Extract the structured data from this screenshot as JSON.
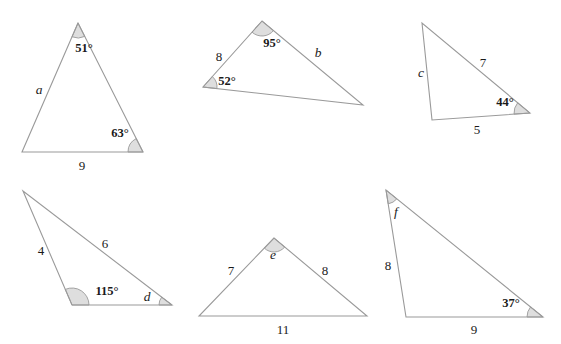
{
  "figure": {
    "background_color": "#ffffff",
    "line_color": "#9a9a9a",
    "arc_fill_color": "#dedede",
    "text_color": "#1a1a1a",
    "width": 561,
    "height": 344
  },
  "triangles": [
    {
      "id": "triangle-1",
      "vertices": [
        [
          78,
          23
        ],
        [
          22,
          152
        ],
        [
          143,
          152
        ]
      ],
      "labels": [
        {
          "name": "angle-51",
          "text": "51°",
          "kind": "angle",
          "x": 84,
          "y": 48
        },
        {
          "name": "side-a",
          "text": "a",
          "kind": "variable",
          "x": 39,
          "y": 90
        },
        {
          "name": "angle-63",
          "text": "63°",
          "kind": "angle",
          "x": 120,
          "y": 133
        },
        {
          "name": "side-9",
          "text": "9",
          "kind": "number",
          "x": 82,
          "y": 165
        }
      ],
      "arcs": [
        {
          "name": "arc-at-apex",
          "vertex": [
            78,
            23
          ],
          "to_a": [
            22,
            152
          ],
          "to_b": [
            143,
            152
          ],
          "radius": 15
        },
        {
          "name": "arc-at-bottom-right",
          "vertex": [
            143,
            152
          ],
          "to_a": [
            78,
            23
          ],
          "to_b": [
            22,
            152
          ],
          "radius": 15
        }
      ]
    },
    {
      "id": "triangle-2",
      "vertices": [
        [
          262,
          21
        ],
        [
          203,
          87
        ],
        [
          363,
          105
        ]
      ],
      "labels": [
        {
          "name": "angle-95",
          "text": "95°",
          "kind": "angle",
          "x": 272,
          "y": 43
        },
        {
          "name": "side-8",
          "text": "8",
          "kind": "number",
          "x": 219,
          "y": 56
        },
        {
          "name": "angle-52",
          "text": "52°",
          "kind": "angle",
          "x": 227,
          "y": 81
        },
        {
          "name": "side-b",
          "text": "b",
          "kind": "variable",
          "x": 318,
          "y": 53
        }
      ],
      "arcs": [
        {
          "name": "arc-at-apex",
          "vertex": [
            262,
            21
          ],
          "to_a": [
            203,
            87
          ],
          "to_b": [
            363,
            105
          ],
          "radius": 15
        },
        {
          "name": "arc-at-left",
          "vertex": [
            203,
            87
          ],
          "to_a": [
            262,
            21
          ],
          "to_b": [
            363,
            105
          ],
          "radius": 14
        }
      ]
    },
    {
      "id": "triangle-3",
      "vertices": [
        [
          422,
          23
        ],
        [
          432,
          120
        ],
        [
          530,
          113
        ]
      ],
      "labels": [
        {
          "name": "side-c",
          "text": "c",
          "kind": "variable",
          "x": 421,
          "y": 73
        },
        {
          "name": "side-7",
          "text": "7",
          "kind": "number",
          "x": 483,
          "y": 62
        },
        {
          "name": "angle-44",
          "text": "44°",
          "kind": "angle",
          "x": 505,
          "y": 102
        },
        {
          "name": "side-5",
          "text": "5",
          "kind": "number",
          "x": 477,
          "y": 129
        }
      ],
      "arcs": [
        {
          "name": "arc-at-right",
          "vertex": [
            530,
            113
          ],
          "to_a": [
            422,
            23
          ],
          "to_b": [
            432,
            120
          ],
          "radius": 16
        }
      ]
    },
    {
      "id": "triangle-4",
      "vertices": [
        [
          23,
          191
        ],
        [
          72,
          305
        ],
        [
          172,
          305
        ]
      ],
      "labels": [
        {
          "name": "side-4",
          "text": "4",
          "kind": "number",
          "x": 41,
          "y": 250
        },
        {
          "name": "side-6",
          "text": "6",
          "kind": "number",
          "x": 105,
          "y": 243
        },
        {
          "name": "angle-115",
          "text": "115°",
          "kind": "angle",
          "x": 107,
          "y": 291
        },
        {
          "name": "angle-d",
          "text": "d",
          "kind": "variable",
          "x": 147,
          "y": 297
        }
      ],
      "arcs": [
        {
          "name": "arc-at-bottom-left",
          "vertex": [
            72,
            305
          ],
          "to_a": [
            23,
            191
          ],
          "to_b": [
            172,
            305
          ],
          "radius": 17
        },
        {
          "name": "arc-at-bottom-right",
          "vertex": [
            172,
            305
          ],
          "to_a": [
            23,
            191
          ],
          "to_b": [
            72,
            305
          ],
          "radius": 13
        }
      ]
    },
    {
      "id": "triangle-5",
      "vertices": [
        [
          274,
          238
        ],
        [
          199,
          316
        ],
        [
          367,
          316
        ]
      ],
      "labels": [
        {
          "name": "angle-e",
          "text": "e",
          "kind": "variable",
          "x": 273,
          "y": 255
        },
        {
          "name": "side-7",
          "text": "7",
          "kind": "number",
          "x": 231,
          "y": 270
        },
        {
          "name": "side-8",
          "text": "8",
          "kind": "number",
          "x": 325,
          "y": 270
        },
        {
          "name": "side-11",
          "text": "11",
          "kind": "number",
          "x": 283,
          "y": 329
        }
      ],
      "arcs": [
        {
          "name": "arc-at-apex",
          "vertex": [
            274,
            238
          ],
          "to_a": [
            199,
            316
          ],
          "to_b": [
            367,
            316
          ],
          "radius": 14
        }
      ]
    },
    {
      "id": "triangle-6",
      "vertices": [
        [
          386,
          190
        ],
        [
          406,
          317
        ],
        [
          543,
          317
        ]
      ],
      "labels": [
        {
          "name": "angle-f",
          "text": "f",
          "kind": "variable",
          "x": 396,
          "y": 212
        },
        {
          "name": "side-8",
          "text": "8",
          "kind": "number",
          "x": 388,
          "y": 265
        },
        {
          "name": "angle-37",
          "text": "37°",
          "kind": "angle",
          "x": 511,
          "y": 303
        },
        {
          "name": "side-9",
          "text": "9",
          "kind": "number",
          "x": 474,
          "y": 329
        }
      ],
      "arcs": [
        {
          "name": "arc-at-top",
          "vertex": [
            386,
            190
          ],
          "to_a": [
            406,
            317
          ],
          "to_b": [
            543,
            317
          ],
          "radius": 14
        },
        {
          "name": "arc-at-bottom-right",
          "vertex": [
            543,
            317
          ],
          "to_a": [
            386,
            190
          ],
          "to_b": [
            406,
            317
          ],
          "radius": 16
        }
      ]
    }
  ]
}
